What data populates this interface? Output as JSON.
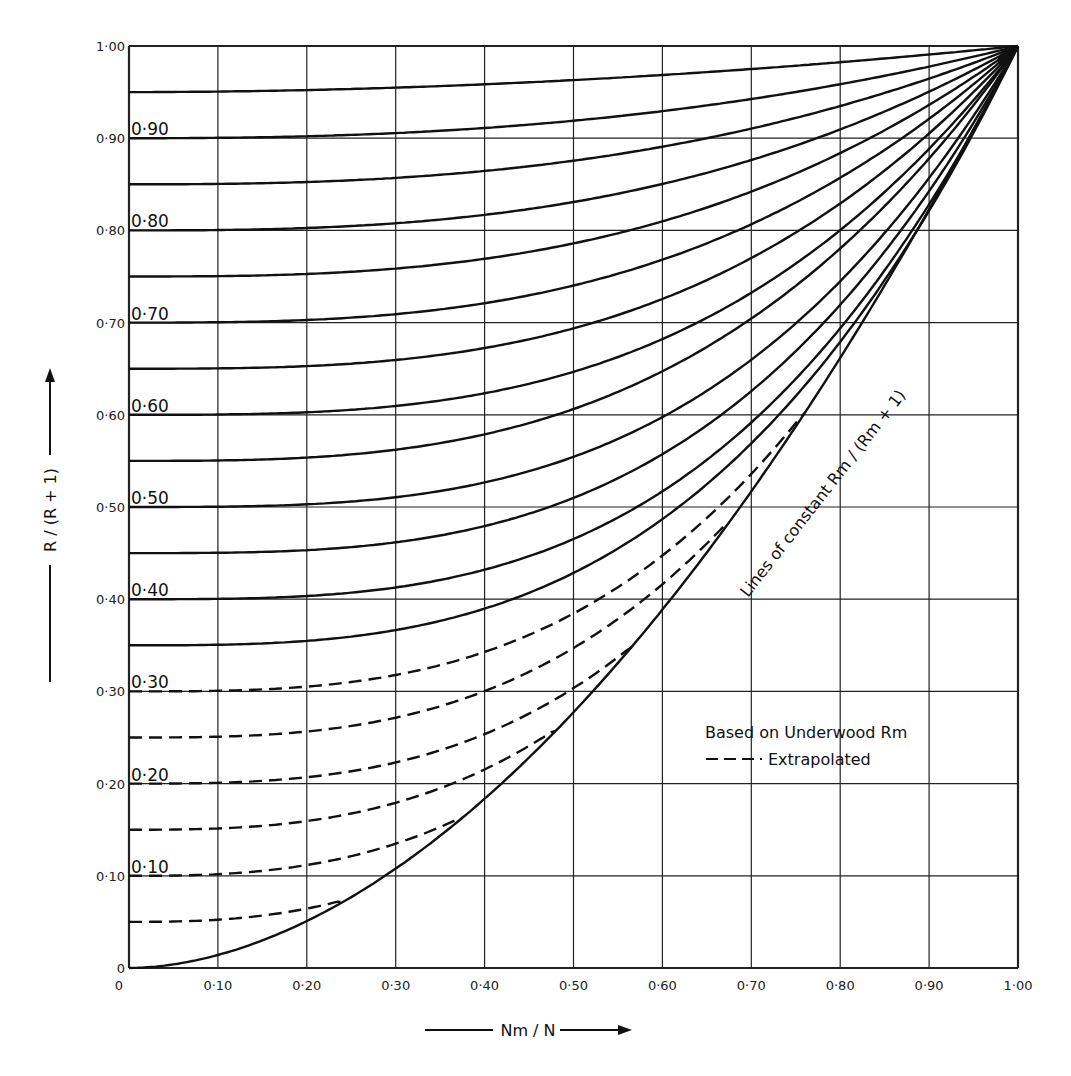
{
  "chart_data": {
    "type": "line",
    "title": "",
    "xlabel": "Nm / N",
    "ylabel": "R / (R + 1)",
    "xlim": [
      0,
      1
    ],
    "ylim": [
      0,
      1
    ],
    "grid": true,
    "x_ticks": [
      "0",
      "0·10",
      "0·20",
      "0·30",
      "0·40",
      "0·50",
      "0·60",
      "0·70",
      "0·80",
      "0·90",
      "1·00"
    ],
    "y_ticks": [
      "0",
      "0·10",
      "0·20",
      "0·30",
      "0·40",
      "0·50",
      "0·60",
      "0·70",
      "0·80",
      "0·90",
      "1·00"
    ],
    "annotation": "Lines of constant Rm / (Rm + 1)",
    "legend": {
      "position": "lower-right",
      "entries": [
        {
          "label": "Based on Underwood Rm",
          "style": "solid"
        },
        {
          "label": "Extrapolated",
          "style": "dashed"
        }
      ]
    },
    "curve_labels": [
      {
        "text": "0·90",
        "y0": 0.9
      },
      {
        "text": "0·80",
        "y0": 0.8
      },
      {
        "text": "0·70",
        "y0": 0.7
      },
      {
        "text": "0·60",
        "y0": 0.6
      },
      {
        "text": "0·50",
        "y0": 0.5
      },
      {
        "text": "0·40",
        "y0": 0.4
      },
      {
        "text": "0·30",
        "y0": 0.3
      },
      {
        "text": "0·20",
        "y0": 0.2
      },
      {
        "text": "0·10",
        "y0": 0.1
      }
    ],
    "x": [
      0,
      0.1,
      0.2,
      0.3,
      0.4,
      0.5,
      0.6,
      0.7,
      0.8,
      0.9,
      1.0
    ],
    "series": [
      {
        "name": "0.95",
        "style": "solid",
        "values": [
          0.95,
          0.951,
          0.953,
          0.955,
          0.958,
          0.963,
          0.969,
          0.976,
          0.984,
          0.992,
          1.0
        ]
      },
      {
        "name": "0.90",
        "style": "solid",
        "values": [
          0.9,
          0.9,
          0.902,
          0.906,
          0.911,
          0.919,
          0.929,
          0.942,
          0.958,
          0.977,
          1.0
        ]
      },
      {
        "name": "0.85",
        "style": "solid",
        "values": [
          0.85,
          0.85,
          0.852,
          0.855,
          0.862,
          0.876,
          0.889,
          0.906,
          0.929,
          0.961,
          1.0
        ]
      },
      {
        "name": "0.80",
        "style": "solid",
        "values": [
          0.8,
          0.8,
          0.801,
          0.804,
          0.812,
          0.83,
          0.845,
          0.868,
          0.901,
          0.945,
          1.0
        ]
      },
      {
        "name": "0.75",
        "style": "solid",
        "values": [
          0.75,
          0.75,
          0.751,
          0.755,
          0.764,
          0.786,
          0.8,
          0.83,
          0.873,
          0.928,
          1.0
        ]
      },
      {
        "name": "0.70",
        "style": "solid",
        "values": [
          0.7,
          0.7,
          0.701,
          0.705,
          0.716,
          0.74,
          0.754,
          0.79,
          0.842,
          0.911,
          1.0
        ]
      },
      {
        "name": "0.65",
        "style": "solid",
        "values": [
          0.65,
          0.65,
          0.651,
          0.655,
          0.666,
          0.694,
          0.707,
          0.748,
          0.808,
          0.892,
          1.0
        ]
      },
      {
        "name": "0.60",
        "style": "solid",
        "values": [
          0.6,
          0.6,
          0.601,
          0.605,
          0.617,
          0.647,
          0.659,
          0.704,
          0.774,
          0.871,
          1.0
        ]
      },
      {
        "name": "0.55",
        "style": "solid",
        "values": [
          0.55,
          0.55,
          0.552,
          0.557,
          0.571,
          0.61,
          0.62,
          0.666,
          0.743,
          0.856,
          1.0
        ]
      },
      {
        "name": "0.50",
        "style": "solid",
        "values": [
          0.5,
          0.5,
          0.502,
          0.506,
          0.518,
          0.559,
          0.566,
          0.616,
          0.701,
          0.833,
          1.0
        ]
      },
      {
        "name": "0.45",
        "style": "solid",
        "values": [
          0.45,
          0.45,
          0.452,
          0.457,
          0.47,
          0.512,
          0.52,
          0.575,
          0.669,
          0.816,
          1.0
        ]
      },
      {
        "name": "0.40",
        "style": "solid",
        "values": [
          0.4,
          0.4,
          0.402,
          0.407,
          0.421,
          0.467,
          0.474,
          0.535,
          0.638,
          0.799,
          1.0
        ]
      },
      {
        "name": "0.35",
        "style": "solid",
        "values": [
          0.35,
          0.351,
          0.353,
          0.36,
          0.377,
          0.426,
          0.434,
          0.5,
          0.612,
          0.787,
          1.0
        ]
      },
      {
        "name": "0.30",
        "style": "dashed",
        "values": [
          0.3,
          0.301,
          0.304,
          0.311,
          0.329,
          0.383,
          0.39,
          0.46,
          0.581,
          0.771,
          1.0
        ]
      },
      {
        "name": "0.25",
        "style": "dashed",
        "values": [
          0.25,
          0.251,
          0.254,
          0.262,
          0.282,
          0.347,
          0.37,
          0.434,
          0.561,
          0.762,
          1.0
        ]
      },
      {
        "name": "0.20",
        "style": "dashed",
        "values": [
          0.2,
          0.201,
          0.205,
          0.214,
          0.236,
          0.304,
          0.37,
          0.434,
          0.561,
          0.762,
          1.0
        ]
      },
      {
        "name": "0.15",
        "style": "dashed",
        "values": [
          0.15,
          0.152,
          0.156,
          0.167,
          0.229,
          0.278,
          0.37,
          0.434,
          0.561,
          0.762,
          1.0
        ]
      },
      {
        "name": "0.10",
        "style": "dashed",
        "values": [
          0.1,
          0.102,
          0.108,
          0.13,
          0.197,
          0.278,
          0.37,
          0.434,
          0.561,
          0.762,
          1.0
        ]
      },
      {
        "name": "0.05",
        "style": "dashed",
        "values": [
          0.05,
          0.053,
          0.07,
          0.13,
          0.197,
          0.278,
          0.37,
          0.434,
          0.561,
          0.762,
          1.0
        ]
      },
      {
        "name": "0.00",
        "style": "solid",
        "values": [
          0.0,
          0.03,
          0.07,
          0.13,
          0.197,
          0.278,
          0.37,
          0.48,
          0.61,
          0.79,
          1.0
        ]
      }
    ],
    "model": {
      "note": "curves plotted as y = y0 + (1 - y0) * x^p, dashed ones clipped at envelope",
      "curves": [
        {
          "y0": 0.95,
          "p": 1.94,
          "style": "solid"
        },
        {
          "y0": 0.9,
          "p": 2.4,
          "style": "solid"
        },
        {
          "y0": 0.85,
          "p": 2.55,
          "style": "solid"
        },
        {
          "y0": 0.8,
          "p": 2.7,
          "style": "solid"
        },
        {
          "y0": 0.75,
          "p": 2.8,
          "style": "solid"
        },
        {
          "y0": 0.7,
          "p": 2.9,
          "style": "solid"
        },
        {
          "y0": 0.65,
          "p": 3.0,
          "style": "solid"
        },
        {
          "y0": 0.6,
          "p": 3.1,
          "style": "solid"
        },
        {
          "y0": 0.55,
          "p": 3.0,
          "style": "solid"
        },
        {
          "y0": 0.5,
          "p": 3.2,
          "style": "solid"
        },
        {
          "y0": 0.45,
          "p": 3.2,
          "style": "solid"
        },
        {
          "y0": 0.4,
          "p": 3.2,
          "style": "solid"
        },
        {
          "y0": 0.35,
          "p": 3.05,
          "style": "solid"
        },
        {
          "y0": 0.3,
          "p": 3.05,
          "style": "dashed"
        },
        {
          "y0": 0.25,
          "p": 2.95,
          "style": "dashed"
        },
        {
          "y0": 0.2,
          "p": 2.95,
          "style": "dashed"
        },
        {
          "y0": 0.15,
          "p": 2.8,
          "style": "dashed"
        },
        {
          "y0": 0.1,
          "p": 2.7,
          "style": "dashed"
        },
        {
          "y0": 0.05,
          "p": 2.6,
          "style": "dashed"
        },
        {
          "y0": 0.0,
          "p": 1.85,
          "style": "solid"
        }
      ]
    }
  },
  "colors": {
    "ink": "#111111",
    "grid": "#222222",
    "background": "#ffffff"
  }
}
